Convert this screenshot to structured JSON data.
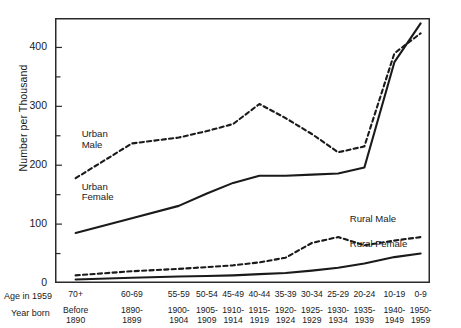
{
  "chart_data": {
    "type": "line",
    "title": "",
    "xlabel": "Age in 1959",
    "ylabel": "Number per Thousand",
    "ylim": [
      0,
      450
    ],
    "yticks": [
      0,
      100,
      200,
      300,
      400
    ],
    "yticks_minor": [
      50,
      150,
      250,
      350
    ],
    "grid": false,
    "legend": "inline-labels",
    "axis_rows": [
      {
        "name": "Age in 1959",
        "label": "Age in 1959"
      },
      {
        "name": "Year born",
        "label": "Year born"
      }
    ],
    "categories": [
      "70+",
      "60-69",
      "55-59",
      "50-54",
      "45-49",
      "40-44",
      "35-39",
      "30-34",
      "25-29",
      "20-24",
      "10-19",
      "0-9"
    ],
    "year_born": [
      "Before\n1890",
      "1890-\n1899",
      "1900-\n1904",
      "1905-\n1909",
      "1910-\n1914",
      "1915-\n1919",
      "1920-\n1924",
      "1925-\n1929",
      "1930-\n1934",
      "1935-\n1939",
      "1940-\n1949",
      "1950-\n1959"
    ],
    "x_positions": [
      0.055,
      0.205,
      0.33,
      0.405,
      0.475,
      0.545,
      0.615,
      0.685,
      0.755,
      0.825,
      0.905,
      0.975
    ],
    "series": [
      {
        "name": "Urban Male",
        "style": "dashed",
        "label": "Urban\nMale",
        "values": [
          178,
          237,
          247,
          258,
          270,
          304,
          280,
          253,
          222,
          232,
          390,
          424
        ]
      },
      {
        "name": "Urban Female",
        "style": "solid",
        "label": "Urban\nFemale",
        "values": [
          85,
          110,
          131,
          152,
          170,
          182,
          182,
          184,
          186,
          196,
          375,
          441
        ]
      },
      {
        "name": "Rural Male",
        "style": "dashed",
        "label": "Rural Male",
        "values": [
          13,
          20,
          24,
          27,
          30,
          35,
          43,
          68,
          78,
          64,
          72,
          78
        ]
      },
      {
        "name": "Rural Female",
        "style": "solid",
        "label": "Rural Female",
        "values": [
          6,
          9,
          11,
          12,
          13,
          15,
          17,
          21,
          26,
          33,
          44,
          50
        ]
      }
    ],
    "series_label_positions": [
      {
        "name": "Urban Male",
        "x": 0.055,
        "y": 244
      },
      {
        "name": "Urban Female",
        "x": 0.055,
        "y": 155
      },
      {
        "name": "Rural Male",
        "x": 0.77,
        "y": 100
      },
      {
        "name": "Rural Female",
        "x": 0.77,
        "y": 58
      }
    ],
    "axis_values": {
      "tick_0": "0",
      "tick_100": "100",
      "tick_200": "200",
      "tick_300": "300",
      "tick_400": "400"
    }
  }
}
